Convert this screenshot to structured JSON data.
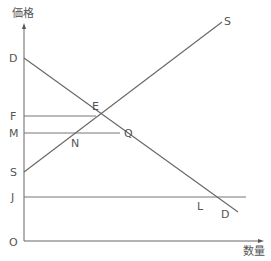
{
  "diagram": {
    "type": "supply-demand",
    "axes": {
      "y_title": "価格",
      "x_title": "数量",
      "origin_label": "O"
    },
    "price_labels": [
      {
        "id": "D",
        "text": "D"
      },
      {
        "id": "F",
        "text": "F"
      },
      {
        "id": "M",
        "text": "M"
      },
      {
        "id": "S",
        "text": "S"
      },
      {
        "id": "J",
        "text": "J"
      }
    ],
    "curves": [
      {
        "id": "demand",
        "end_label": "D"
      },
      {
        "id": "supply",
        "end_label": "S"
      }
    ],
    "points": [
      {
        "id": "E",
        "text": "E"
      },
      {
        "id": "N",
        "text": "N"
      },
      {
        "id": "Q",
        "text": "Q"
      },
      {
        "id": "L",
        "text": "L"
      }
    ],
    "colors": {
      "line": "#666666",
      "text": "#555555"
    }
  }
}
